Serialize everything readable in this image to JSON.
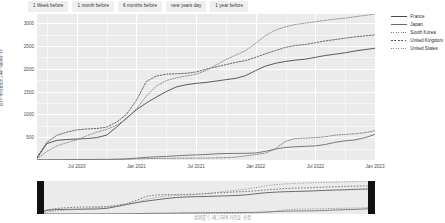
{
  "toolbar": {
    "buttons": [
      {
        "label": "1 Week before",
        "name": "range-1-week"
      },
      {
        "label": "1 month before",
        "name": "range-1-month"
      },
      {
        "label": "6 months before",
        "name": "range-6-months"
      },
      {
        "label": "new years day",
        "name": "range-new-years-day"
      },
      {
        "label": "1 year before",
        "name": "range-1-year"
      }
    ]
  },
  "caption": "범위를 드래그하여 기간을 조정",
  "slider": {
    "left_handle": "range-start-handle",
    "right_handle": "range-end-handle"
  },
  "chart_data": {
    "type": "line",
    "title": "",
    "xlabel": "",
    "ylabel": "인구 백만명당 누적 사망자 수",
    "ylim": [
      0,
      3200
    ],
    "yticks": [
      500,
      1000,
      1500,
      2000,
      2500,
      3000
    ],
    "xticks": [
      "Jul 2020",
      "Jan 2021",
      "Jul 2021",
      "Jan 2022",
      "Jul 2022",
      "Jan 2023"
    ],
    "xlim": [
      "Mar 2020",
      "Feb 2023"
    ],
    "grid": true,
    "legend_position": "right",
    "x": [
      "Mar 2020",
      "Apr 2020",
      "May 2020",
      "Jun 2020",
      "Jul 2020",
      "Aug 2020",
      "Sep 2020",
      "Oct 2020",
      "Nov 2020",
      "Dec 2020",
      "Jan 2021",
      "Feb 2021",
      "Mar 2021",
      "Apr 2021",
      "May 2021",
      "Jun 2021",
      "Jul 2021",
      "Aug 2021",
      "Sep 2021",
      "Oct 2021",
      "Nov 2021",
      "Dec 2021",
      "Jan 2022",
      "Feb 2022",
      "Mar 2022",
      "Apr 2022",
      "May 2022",
      "Jun 2022",
      "Jul 2022",
      "Aug 2022",
      "Sep 2022",
      "Oct 2022",
      "Nov 2022",
      "Dec 2022",
      "Jan 2023"
    ],
    "series": [
      {
        "name": "France",
        "color": "#4a4a4a",
        "style": "solid",
        "values": [
          40,
          360,
          430,
          450,
          460,
          470,
          490,
          545,
          720,
          920,
          1100,
          1250,
          1380,
          1500,
          1600,
          1650,
          1680,
          1700,
          1730,
          1760,
          1790,
          1850,
          1960,
          2060,
          2120,
          2160,
          2190,
          2210,
          2250,
          2290,
          2320,
          2350,
          2390,
          2420,
          2450
        ]
      },
      {
        "name": "Japan",
        "color": "#6b6b6b",
        "style": "solid",
        "values": [
          2,
          4,
          6,
          8,
          9,
          11,
          14,
          14,
          18,
          25,
          40,
          58,
          70,
          78,
          92,
          104,
          112,
          120,
          135,
          142,
          144,
          146,
          155,
          190,
          240,
          275,
          290,
          300,
          310,
          340,
          390,
          420,
          440,
          490,
          560
        ]
      },
      {
        "name": "South Korea",
        "color": "#7a7a7a",
        "style": "dotted",
        "values": [
          3,
          4,
          5,
          6,
          7,
          7,
          8,
          8,
          10,
          16,
          24,
          31,
          34,
          36,
          38,
          40,
          41,
          42,
          46,
          50,
          62,
          90,
          120,
          150,
          250,
          410,
          470,
          480,
          490,
          510,
          545,
          560,
          575,
          600,
          640
        ]
      },
      {
        "name": "United Kingdom",
        "color": "#5a5a5a",
        "style": "dashed",
        "values": [
          60,
          390,
          540,
          610,
          660,
          680,
          690,
          720,
          830,
          1000,
          1310,
          1720,
          1840,
          1880,
          1890,
          1900,
          1930,
          1990,
          2040,
          2090,
          2140,
          2180,
          2250,
          2330,
          2400,
          2470,
          2510,
          2530,
          2570,
          2610,
          2640,
          2670,
          2700,
          2720,
          2740
        ]
      },
      {
        "name": "United States",
        "color": "#888888",
        "style": "dotted",
        "values": [
          20,
          190,
          310,
          380,
          440,
          530,
          610,
          670,
          760,
          900,
          1120,
          1400,
          1620,
          1740,
          1800,
          1840,
          1880,
          1960,
          2080,
          2200,
          2300,
          2400,
          2560,
          2730,
          2850,
          2920,
          2970,
          3000,
          3030,
          3060,
          3090,
          3110,
          3140,
          3170,
          3200
        ]
      }
    ]
  }
}
